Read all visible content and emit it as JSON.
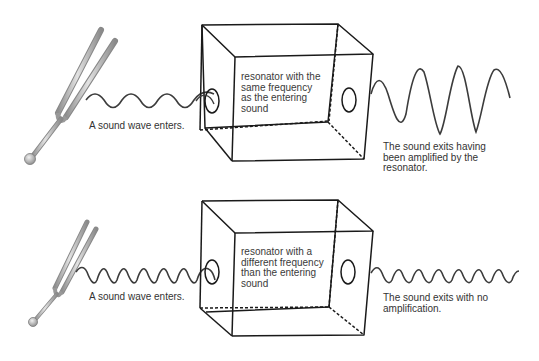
{
  "panels": [
    {
      "id": "top",
      "enter_label": "A sound wave enters.",
      "resonator_label": "resonator with the\nsame frequency\nas the entering\nsound",
      "exit_label": "The sound exits having\nbeen amplified by the\nresonator.",
      "outcome": "amplified"
    },
    {
      "id": "bottom",
      "enter_label": "A sound wave enters.",
      "resonator_label": "resonator with a\ndifferent frequency\nthan the entering\nsound",
      "exit_label": "The sound exits with no\namplification.",
      "outcome": "not amplified"
    }
  ],
  "icons": {
    "source": "tuning-fork-icon",
    "resonator": "resonator-box-icon"
  },
  "colors": {
    "line": "#1a1a1a",
    "wave": "#3c3c3c",
    "text": "#333333",
    "fork": "#b8b8b8",
    "fork_shade": "#8a8a8a"
  }
}
